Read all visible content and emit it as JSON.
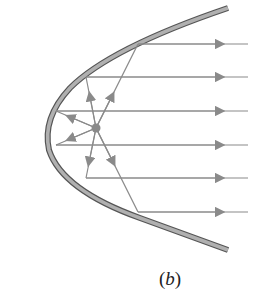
{
  "figure": {
    "caption_open": "(",
    "caption_letter": "b",
    "caption_close": ")",
    "colors": {
      "mirror_fill": "#a9a9a9",
      "mirror_edge": "#555555",
      "ray": "#8a8a8a",
      "focus": "#8a8a8a"
    },
    "focus": {
      "x": 96,
      "y": 128
    },
    "rays_y": [
      44,
      77,
      111,
      145,
      178,
      212
    ],
    "ray_end_x": 248
  }
}
